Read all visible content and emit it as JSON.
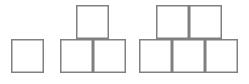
{
  "canvas": {
    "width": 249,
    "height": 84,
    "background_color": "#ffffff"
  },
  "style": {
    "stroke_color": "#808080",
    "stroke_width": 1.5,
    "fill_color": "#ffffff",
    "cell_width": 33,
    "cell_height": 34
  },
  "diagram": {
    "kind": "growing-square-block-pattern",
    "figure_count": 3,
    "total_squares": 9,
    "square_counts": [
      1,
      3,
      5
    ],
    "figures": [
      {
        "name": "figure-1",
        "square_count": 1,
        "rows": [
          {
            "name": "bottom-row",
            "count": 1
          }
        ],
        "cells": [
          {
            "name": "figure-1-bottom-1",
            "x": 11,
            "y": 39,
            "w": 33,
            "h": 34
          }
        ]
      },
      {
        "name": "figure-2",
        "square_count": 3,
        "rows": [
          {
            "name": "top-row",
            "count": 1
          },
          {
            "name": "bottom-row",
            "count": 2
          }
        ],
        "cells": [
          {
            "name": "figure-2-top-1",
            "x": 76,
            "y": 5,
            "w": 33,
            "h": 34
          },
          {
            "name": "figure-2-bottom-1",
            "x": 60,
            "y": 39,
            "w": 33,
            "h": 34
          },
          {
            "name": "figure-2-bottom-2",
            "x": 93,
            "y": 39,
            "w": 33,
            "h": 34
          }
        ]
      },
      {
        "name": "figure-3",
        "square_count": 5,
        "rows": [
          {
            "name": "top-row",
            "count": 2
          },
          {
            "name": "bottom-row",
            "count": 3
          }
        ],
        "cells": [
          {
            "name": "figure-3-top-1",
            "x": 156,
            "y": 5,
            "w": 33,
            "h": 34
          },
          {
            "name": "figure-3-top-2",
            "x": 189,
            "y": 5,
            "w": 33,
            "h": 34
          },
          {
            "name": "figure-3-bottom-1",
            "x": 139,
            "y": 39,
            "w": 33,
            "h": 34
          },
          {
            "name": "figure-3-bottom-2",
            "x": 172,
            "y": 39,
            "w": 33,
            "h": 34
          },
          {
            "name": "figure-3-bottom-3",
            "x": 205,
            "y": 39,
            "w": 33,
            "h": 34
          }
        ]
      }
    ]
  }
}
